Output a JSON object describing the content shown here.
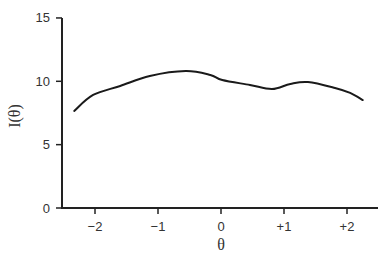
{
  "chart_data": {
    "type": "line",
    "title": "",
    "xlabel": "θ",
    "ylabel": "I(θ)",
    "xlim": [
      -2.6,
      2.5
    ],
    "ylim": [
      0,
      15
    ],
    "grid": false,
    "legend": null,
    "xticks": [
      -2,
      -1,
      0,
      1,
      2
    ],
    "xtick_labels": [
      "−2",
      "−1",
      "0",
      "+1",
      "+2"
    ],
    "yticks": [
      0,
      5,
      10,
      15
    ],
    "ytick_labels": [
      "0",
      "5",
      "10",
      "15"
    ],
    "series": [
      {
        "name": "I(θ)",
        "color": "#1a1a1a",
        "x": [
          -2.33,
          -2.03,
          -1.6,
          -1.13,
          -0.56,
          -0.17,
          0.02,
          0.46,
          0.81,
          1.1,
          1.38,
          1.81,
          2.05,
          2.25
        ],
        "y": [
          7.66,
          8.92,
          9.63,
          10.42,
          10.81,
          10.5,
          10.1,
          9.71,
          9.39,
          9.79,
          9.94,
          9.47,
          9.08,
          8.52
        ]
      }
    ]
  }
}
